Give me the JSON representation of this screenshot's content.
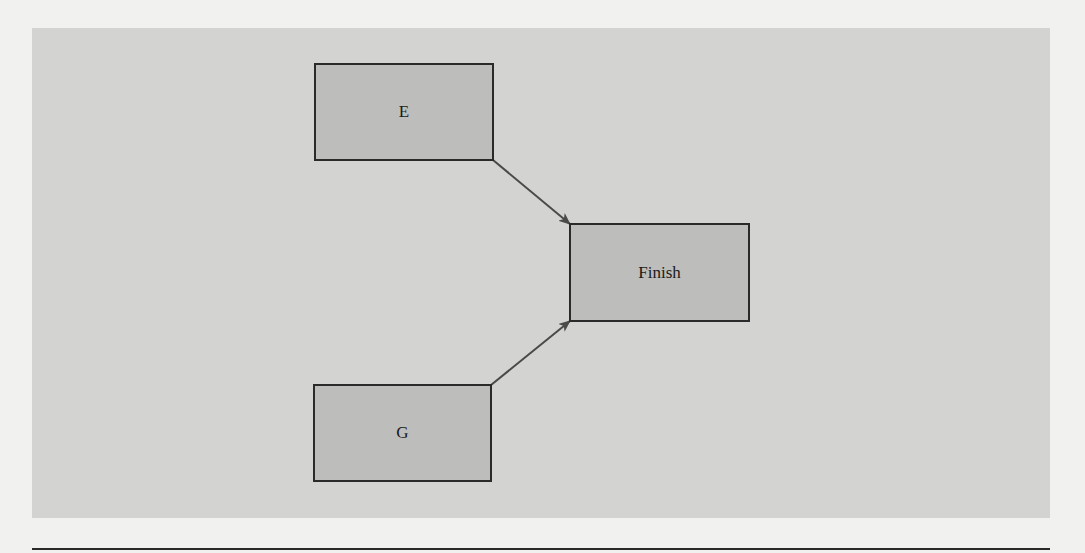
{
  "diagram": {
    "type": "network-diagram",
    "background_color": "#d3d3d1",
    "node_fill": "#bdbdbb",
    "edge_color": "#4a4a4a",
    "nodes": [
      {
        "id": "E",
        "label": "E"
      },
      {
        "id": "Finish",
        "label": "Finish"
      },
      {
        "id": "G",
        "label": "G"
      }
    ],
    "edges": [
      {
        "from": "E",
        "to": "Finish"
      },
      {
        "from": "G",
        "to": "Finish"
      }
    ]
  }
}
